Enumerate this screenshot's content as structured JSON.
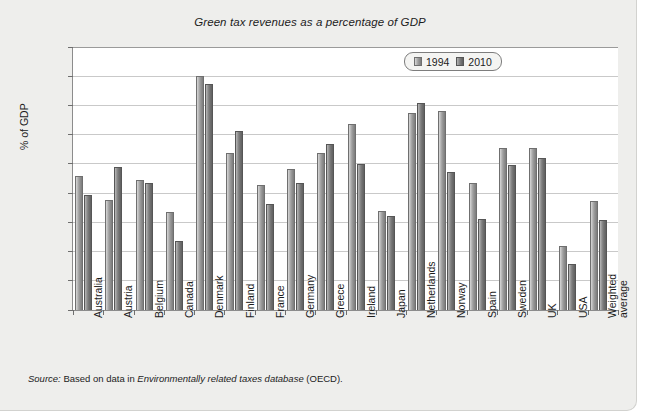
{
  "chart_data": {
    "type": "bar",
    "title": "Green tax revenues as a percentage of GDP",
    "xlabel": "",
    "ylabel": "% of GDP",
    "ylim": [
      0,
      4.5
    ],
    "ytick_step": 0.5,
    "yticks": [
      "4.5",
      "4",
      "3.5",
      "3",
      "2.5",
      "2",
      "1.5",
      "1",
      "0.5",
      "0"
    ],
    "grid": true,
    "legend_position": "top-right",
    "categories": [
      "Australia",
      "Austria",
      "Belgium",
      "Canada",
      "Denmark",
      "Finland",
      "France",
      "Germany",
      "Greece",
      "Ireland",
      "Japan",
      "Netherlands",
      "Norway",
      "Spain",
      "Sweden",
      "UK",
      "USA",
      "Weighted average"
    ],
    "series": [
      {
        "name": "1994",
        "color": "#9f9f9f",
        "values": [
          2.3,
          1.89,
          2.22,
          1.67,
          4.0,
          2.68,
          2.14,
          2.42,
          2.68,
          3.18,
          1.69,
          3.37,
          3.41,
          2.17,
          2.77,
          2.78,
          1.1,
          1.87
        ]
      },
      {
        "name": "2010",
        "color": "#7e7e7e",
        "values": [
          1.97,
          2.45,
          2.17,
          1.18,
          3.86,
          3.07,
          1.82,
          2.17,
          2.84,
          2.49,
          1.61,
          3.54,
          2.37,
          1.56,
          2.48,
          2.6,
          0.78,
          1.54
        ]
      }
    ]
  },
  "source": {
    "label": "Source:",
    "text_before": " Based on data in ",
    "italic_part": "Environmentally related taxes database",
    "text_after": " (OECD)."
  }
}
